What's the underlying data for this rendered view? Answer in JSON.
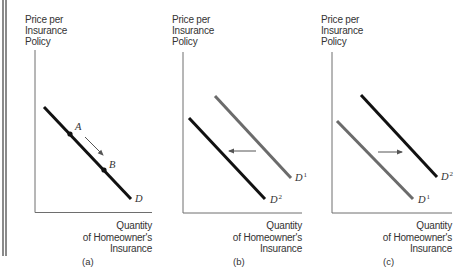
{
  "colors": {
    "axis": "#6e6e6e",
    "black_curve": "#111111",
    "gray_curve": "#6b6b6b",
    "arrow": "#555555",
    "text": "#333333",
    "border": "#8a8a8a"
  },
  "panels": [
    {
      "id": "a",
      "panel_label": "(a)",
      "y_axis_label": [
        "Price per",
        "Insurance",
        "Policy"
      ],
      "x_axis_label": [
        "Quantity",
        "of Homeowner's",
        "Insurance"
      ],
      "curves": [
        {
          "name": "D",
          "sup": "",
          "color": "black",
          "x1": 44,
          "y1": 107,
          "x2": 131,
          "y2": 199
        }
      ],
      "points": [
        {
          "label": "A",
          "x": 70,
          "y": 134
        },
        {
          "label": "B",
          "x": 104,
          "y": 170
        }
      ],
      "arrow": {
        "direction": "down-right (movement along curve)",
        "x1": 85,
        "y1": 137,
        "x2": 103,
        "y2": 155
      }
    },
    {
      "id": "b",
      "panel_label": "(b)",
      "y_axis_label": [
        "Price per",
        "Insurance",
        "Policy"
      ],
      "x_axis_label": [
        "Quantity",
        "of Homeowner's",
        "Insurance"
      ],
      "curves": [
        {
          "name": "D",
          "sup": "1",
          "color": "gray",
          "x1": 215,
          "y1": 96,
          "x2": 291,
          "y2": 178
        },
        {
          "name": "D",
          "sup": "2",
          "color": "black",
          "x1": 189,
          "y1": 118,
          "x2": 265,
          "y2": 199
        }
      ],
      "points": [],
      "arrow": {
        "direction": "left (decrease in demand)",
        "x1": 256,
        "y1": 151,
        "x2": 229,
        "y2": 151
      }
    },
    {
      "id": "c",
      "panel_label": "(c)",
      "y_axis_label": [
        "Price per",
        "Insurance",
        "Policy"
      ],
      "x_axis_label": [
        "Quantity",
        "of Homeowner's",
        "Insurance"
      ],
      "curves": [
        {
          "name": "D",
          "sup": "1",
          "color": "gray",
          "x1": 337,
          "y1": 121,
          "x2": 413,
          "y2": 199
        },
        {
          "name": "D",
          "sup": "2",
          "color": "black",
          "x1": 361,
          "y1": 95,
          "x2": 437,
          "y2": 177
        }
      ],
      "points": [],
      "arrow": {
        "direction": "right (increase in demand)",
        "x1": 378,
        "y1": 152,
        "x2": 402,
        "y2": 152
      }
    }
  ]
}
